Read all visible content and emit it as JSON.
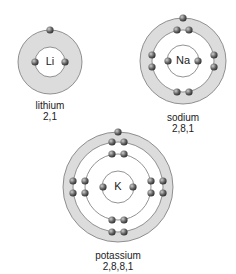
{
  "diagram": {
    "atoms": [
      {
        "name": "lithium",
        "symbol": "Li",
        "configuration": "2,1"
      },
      {
        "name": "sodium",
        "symbol": "Na",
        "configuration": "2,8,1"
      },
      {
        "name": "potassium",
        "symbol": "K",
        "configuration": "2,8,8,1"
      }
    ]
  },
  "colors": {
    "ring_fill": "#dcdcdc",
    "ring_stroke": "#777777",
    "electron": "#555555"
  }
}
